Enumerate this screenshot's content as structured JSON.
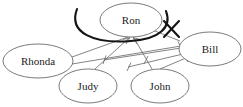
{
  "diagram": {
    "kind": "hand-drawn node-and-arrow social network diagram",
    "canvas": {
      "width": 243,
      "height": 107,
      "background": "#ffffff"
    },
    "colors": {
      "node_outline": "#6b6b6b",
      "node_fill": "#ffffff",
      "edge": "#6e6e6e",
      "bold_stroke": "#141414",
      "label_text": "#1c1c1c"
    },
    "nodes": [
      {
        "id": "ron",
        "label": "Ron",
        "cx": 131,
        "cy": 20,
        "rx": 31,
        "ry": 17
      },
      {
        "id": "rhonda",
        "label": "Rhonda",
        "cx": 38,
        "cy": 61,
        "rx": 35,
        "ry": 17
      },
      {
        "id": "judy",
        "label": "Judy",
        "cx": 88,
        "cy": 86,
        "rx": 29,
        "ry": 17
      },
      {
        "id": "john",
        "label": "John",
        "cx": 160,
        "cy": 86,
        "rx": 29,
        "ry": 17
      },
      {
        "id": "bill",
        "label": "Bill",
        "cx": 210,
        "cy": 49,
        "rx": 31,
        "ry": 17
      }
    ],
    "edges": [
      {
        "id": "judy-to-ron",
        "from": "judy",
        "to": "ron",
        "tip": "arrow"
      },
      {
        "id": "john-to-ron",
        "from": "john",
        "to": "ron",
        "tip": "arrow"
      },
      {
        "id": "rhonda-to-ron",
        "from": "rhonda",
        "to": "ron",
        "tip": "plain"
      },
      {
        "id": "bill-to-ron",
        "from": "bill",
        "to": "ron",
        "tip": "plain"
      },
      {
        "id": "rhonda-to-bill",
        "from": "rhonda",
        "to": "bill",
        "tip": "tbar"
      },
      {
        "id": "bill-to-judy",
        "from": "bill",
        "to": "judy",
        "tip": "tbar"
      },
      {
        "id": "bill-to-john",
        "from": "bill",
        "to": "john",
        "tip": "tbar"
      },
      {
        "id": "john-to-bill",
        "from": "john",
        "to": "bill",
        "tip": "tbar"
      }
    ],
    "annotations": [
      {
        "id": "blocking-arc",
        "kind": "bold-arc",
        "description": "heavy curved arc drawn beneath and around the Ron node"
      },
      {
        "id": "x-mark",
        "kind": "x-mark",
        "label": "X",
        "cx": 171,
        "cy": 29,
        "description": "bold X crossing the right end of the arc"
      }
    ]
  }
}
